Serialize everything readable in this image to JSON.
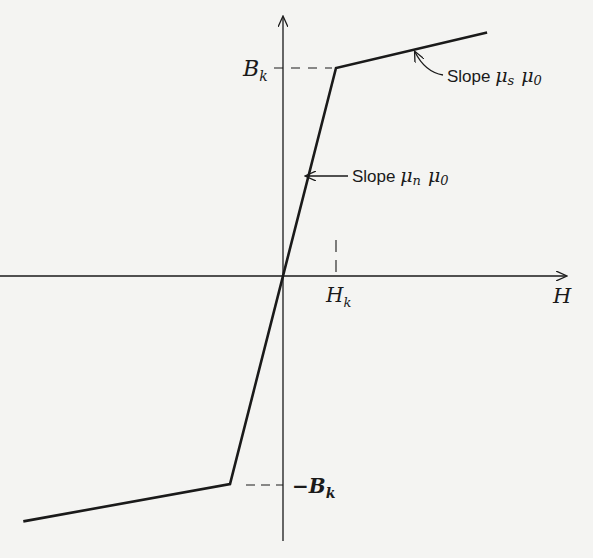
{
  "diagram": {
    "axes": {
      "x_label": "H",
      "y_label": ""
    },
    "markers": {
      "bk_label": "B",
      "bk_sub": "k",
      "neg_bk_label": "−B",
      "neg_bk_sub": "k",
      "hk_label": "H",
      "hk_sub": "k"
    },
    "annotations": [
      {
        "id": "slope-sat",
        "text": "Slope ",
        "mu": "μ",
        "mu_sub": "s",
        "mu0": "μ",
        "mu0_sub": "0"
      },
      {
        "id": "slope-normal",
        "text": "Slope ",
        "mu": "μ",
        "mu_sub": "n",
        "mu0": "μ",
        "mu0_sub": "0"
      }
    ],
    "curve_points_normalized": [
      {
        "H": -4.9,
        "B": -1.18
      },
      {
        "H": -1.0,
        "B": -1.0
      },
      {
        "H": 1.0,
        "B": 1.0
      },
      {
        "H": 3.85,
        "B": 1.17
      }
    ],
    "colors": {
      "background": "#f4f4f2",
      "ink": "#1a1a1a"
    }
  }
}
